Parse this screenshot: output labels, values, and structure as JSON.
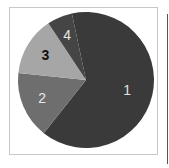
{
  "chart_data": {
    "type": "pie",
    "title": "",
    "categories": [
      "1",
      "2",
      "3",
      "4"
    ],
    "values": [
      64,
      16,
      14,
      6
    ],
    "colors": [
      "#3a3a3a",
      "#6e6e6e",
      "#a6a6a6",
      "#454545"
    ],
    "label_colors": [
      "#e0e0e0",
      "#e8e8e8",
      "#111111",
      "#e8e8e8"
    ],
    "start_angle_deg": 0,
    "direction": "clockwise",
    "legend": "none",
    "slice_labels": [
      "1",
      "2",
      "3",
      "4"
    ]
  }
}
